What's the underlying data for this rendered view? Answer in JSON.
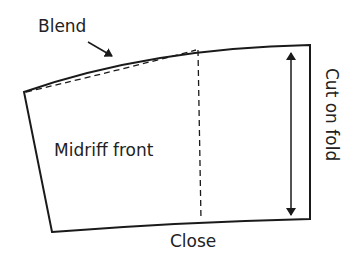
{
  "diagram": {
    "labels": {
      "blend": "Blend",
      "piece_name": "Midriff front",
      "close": "Close",
      "fold": "Cut on fold"
    },
    "colors": {
      "line": "#1a1a1a",
      "text": "#222222",
      "background": "#ffffff"
    }
  }
}
